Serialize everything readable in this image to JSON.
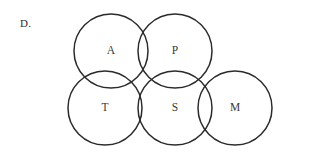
{
  "figure": {
    "option_label": "D.",
    "background_color": "#ffffff",
    "stroke_color": "#2b2b2b",
    "letter_color": "#3a3a3a",
    "stroke_width": 1.5,
    "radius": 37
  },
  "circles": [
    {
      "id": "a",
      "label": "A",
      "cx": 111,
      "cy": 51,
      "r": 37,
      "row": "top"
    },
    {
      "id": "p",
      "label": "P",
      "cx": 175,
      "cy": 51,
      "r": 37,
      "row": "top"
    },
    {
      "id": "t",
      "label": "T",
      "cx": 105,
      "cy": 108,
      "r": 37,
      "row": "bottom"
    },
    {
      "id": "s",
      "label": "S",
      "cx": 175,
      "cy": 108,
      "r": 37,
      "row": "bottom"
    },
    {
      "id": "m",
      "label": "M",
      "cx": 235,
      "cy": 108,
      "r": 37,
      "row": "bottom"
    }
  ],
  "chart_data": {
    "type": "diagram",
    "diagram_kind": "venn",
    "title": "D.",
    "set_labels": [
      "A",
      "P",
      "T",
      "S",
      "M"
    ],
    "set_count": 5,
    "overlaps": [
      [
        "A",
        "P"
      ],
      [
        "A",
        "T"
      ],
      [
        "A",
        "S"
      ],
      [
        "P",
        "S"
      ],
      [
        "T",
        "S"
      ],
      [
        "S",
        "M"
      ]
    ]
  }
}
